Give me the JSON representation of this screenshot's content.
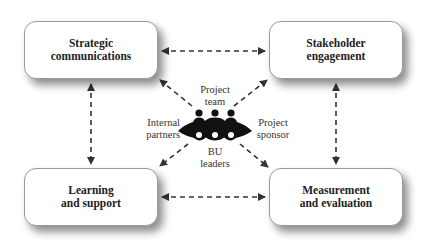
{
  "diagram": {
    "boxes": {
      "top_left": {
        "label": "Strategic\ncommunications"
      },
      "top_right": {
        "label": "Stakeholder\nengagement"
      },
      "bottom_left": {
        "label": "Learning\nand support"
      },
      "bottom_right": {
        "label": "Measurement\nand evaluation"
      }
    },
    "center": {
      "icon": "people-group-icon",
      "roles": {
        "top": "Project\nteam",
        "left": "Internal\npartners",
        "right": "Project\nsponsor",
        "bottom": "BU\nleaders"
      }
    },
    "connectors": [
      {
        "from": "top_left",
        "to": "top_right",
        "style": "dashed",
        "arrows": "both"
      },
      {
        "from": "bottom_left",
        "to": "bottom_right",
        "style": "dashed",
        "arrows": "both"
      },
      {
        "from": "top_left",
        "to": "bottom_left",
        "style": "dashed",
        "arrows": "both"
      },
      {
        "from": "top_right",
        "to": "bottom_right",
        "style": "dashed",
        "arrows": "both"
      },
      {
        "from": "center",
        "to": "top_left",
        "style": "dashed",
        "arrows": "end"
      },
      {
        "from": "center",
        "to": "top_right",
        "style": "dashed",
        "arrows": "end"
      },
      {
        "from": "center",
        "to": "bottom_left",
        "style": "dashed",
        "arrows": "end"
      },
      {
        "from": "center",
        "to": "bottom_right",
        "style": "dashed",
        "arrows": "end"
      }
    ],
    "colors": {
      "line": "#333333",
      "icon": "#111111",
      "box_border": "#9a9a9a"
    }
  }
}
